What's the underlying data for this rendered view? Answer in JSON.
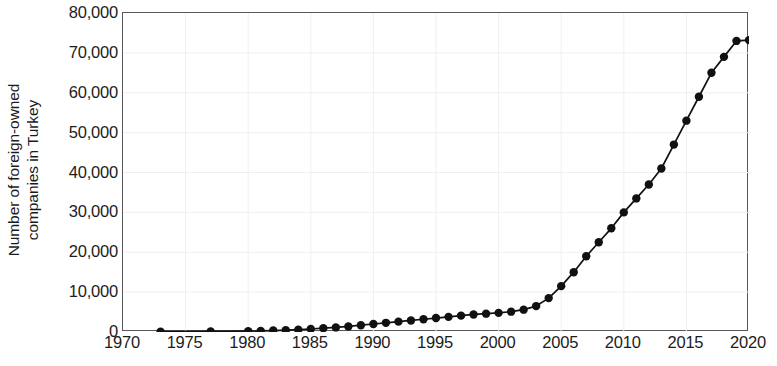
{
  "chart_data": {
    "type": "line",
    "title": "",
    "subtitle": "",
    "xlabel": "",
    "ylabel": "Number of foreign-owned companies in Turkey",
    "ylabel_line1": "Number of foreign-owned",
    "ylabel_line2": "companies in Turkey",
    "xlim": [
      1970,
      2020
    ],
    "ylim": [
      0,
      80000
    ],
    "xticks": [
      1970,
      1975,
      1980,
      1985,
      1990,
      1995,
      2000,
      2005,
      2010,
      2015,
      2020
    ],
    "xtick_labels": [
      "1970",
      "1975",
      "1980",
      "1985",
      "1990",
      "1995",
      "2000",
      "2005",
      "2010",
      "2015",
      "2020"
    ],
    "yticks": [
      0,
      10000,
      20000,
      30000,
      40000,
      50000,
      60000,
      70000,
      80000
    ],
    "ytick_labels": [
      "0",
      "10,000",
      "20,000",
      "30,000",
      "40,000",
      "50,000",
      "60,000",
      "70,000",
      "80,000"
    ],
    "grid": true,
    "grid_color": "#efefef",
    "legend": false,
    "legend_position": "none",
    "line_color": "#111111",
    "marker": "circle",
    "marker_color": "#111111",
    "series": [
      {
        "name": "Number of foreign-owned companies in Turkey",
        "x": [
          1973,
          1977,
          1980,
          1981,
          1982,
          1983,
          1984,
          1985,
          1986,
          1987,
          1988,
          1989,
          1990,
          1991,
          1992,
          1993,
          1994,
          1995,
          1996,
          1997,
          1998,
          1999,
          2000,
          2001,
          2002,
          2003,
          2004,
          2005,
          2006,
          2007,
          2008,
          2009,
          2010,
          2011,
          2012,
          2013,
          2014,
          2015,
          2016,
          2017,
          2018,
          2019,
          2020
        ],
        "values": [
          100,
          150,
          200,
          280,
          360,
          450,
          580,
          750,
          950,
          1150,
          1400,
          1700,
          2000,
          2300,
          2600,
          2900,
          3200,
          3500,
          3800,
          4100,
          4400,
          4600,
          4800,
          5100,
          5600,
          6500,
          8500,
          11500,
          15000,
          19000,
          22500,
          26000,
          30000,
          33500,
          37000,
          41000,
          47000,
          53000,
          59000,
          65000,
          69000,
          73000,
          73200
        ]
      }
    ]
  }
}
